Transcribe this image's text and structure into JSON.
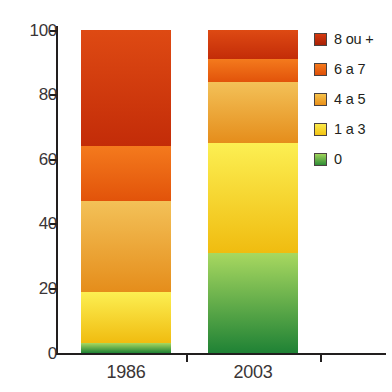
{
  "chart_data": {
    "type": "bar",
    "stacked": true,
    "title": "",
    "subtitle": "",
    "xlabel": "",
    "ylabel": "",
    "categories": [
      "1986",
      "2003"
    ],
    "ylim": [
      0,
      100
    ],
    "y_ticks": [
      0,
      20,
      40,
      60,
      80,
      100
    ],
    "y_tick_labels": [
      "0",
      "20",
      "40",
      "60",
      "80",
      "100"
    ],
    "grid": false,
    "legend_position": "right",
    "series": [
      {
        "name": "0",
        "color": "#3f9b3c",
        "values": [
          3,
          31
        ]
      },
      {
        "name": "1 a 3",
        "color": "#fada2b",
        "values": [
          16,
          34
        ]
      },
      {
        "name": "4 a 5",
        "color": "#f0a62e",
        "values": [
          28,
          19
        ]
      },
      {
        "name": "6 a 7",
        "color": "#ef6c14",
        "values": [
          17,
          7
        ]
      },
      {
        "name": "8 ou +",
        "color": "#d5390f",
        "values": [
          36,
          9
        ]
      }
    ],
    "stack_order_bottom_to_top": [
      "0",
      "1 a 3",
      "4 a 5",
      "6 a 7",
      "8 ou +"
    ],
    "cumulative_boundaries": {
      "1986": [
        0,
        3,
        19,
        47,
        64,
        100
      ],
      "2003": [
        0,
        31,
        65,
        84,
        91,
        100
      ]
    }
  },
  "legend": {
    "items": [
      {
        "label": "8 ou +",
        "swatch_top": "#d5390f",
        "swatch_bottom": "#a82105"
      },
      {
        "label": "6 a 7",
        "swatch_top": "#f5791b",
        "swatch_bottom": "#de4f08"
      },
      {
        "label": "4 a 5",
        "swatch_top": "#f6c24a",
        "swatch_bottom": "#e98f18"
      },
      {
        "label": "1 a 3",
        "swatch_top": "#fbe94a",
        "swatch_bottom": "#f2c313"
      },
      {
        "label": "0",
        "swatch_top": "#9ed35a",
        "swatch_bottom": "#2f8c36"
      }
    ]
  },
  "axes": {
    "y_labels": [
      "100",
      "80",
      "60",
      "40",
      "20",
      "0"
    ],
    "x_labels": [
      "1986",
      "2003"
    ]
  },
  "colors": {
    "axis": "#221f1f",
    "text": "#3a3536",
    "background": "#ffffff"
  }
}
